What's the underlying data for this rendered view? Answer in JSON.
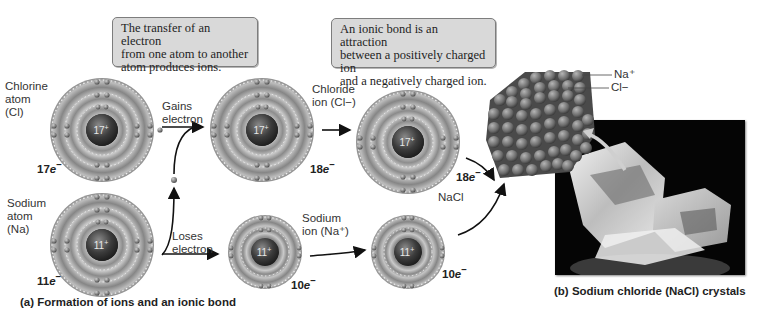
{
  "callouts": {
    "transfer": {
      "line1": "The transfer of an electron",
      "line2": "from one atom to another",
      "line3": "atom produces ions."
    },
    "ionic_bond": {
      "line1": "An ionic bond is an attraction",
      "line2": "between a positively charged ion",
      "line3": "and a negatively charged ion."
    }
  },
  "atoms": {
    "chlorine_atom": {
      "name_line1": "Chlorine",
      "name_line2": "atom",
      "name_line3": "(Cl)",
      "nucleus": "17",
      "nucleus_charge": "+",
      "electron_count": "17",
      "electron_suffix": "e",
      "electron_sign": "−"
    },
    "sodium_atom": {
      "name_line1": "Sodium",
      "name_line2": "atom",
      "name_line3": "(Na)",
      "nucleus": "11",
      "nucleus_charge": "+",
      "electron_count": "11",
      "electron_suffix": "e",
      "electron_sign": "−"
    },
    "chloride_ion": {
      "name_line1": "Chloride",
      "name_line2": "ion (Cl−)",
      "nucleus": "17",
      "nucleus_charge": "+",
      "electron_count": "18",
      "electron_suffix": "e",
      "electron_sign": "−"
    },
    "sodium_ion": {
      "name_line1": "Sodium",
      "name_line2": "ion (Na⁺)",
      "nucleus": "11",
      "nucleus_charge": "+",
      "electron_count": "10",
      "electron_suffix": "e",
      "electron_sign": "−"
    },
    "nacl_chloride": {
      "nucleus": "17",
      "nucleus_charge": "+",
      "electron_count": "18",
      "electron_suffix": "e",
      "electron_sign": "−"
    },
    "nacl_sodium": {
      "nucleus": "11",
      "nucleus_charge": "+",
      "electron_count": "10",
      "electron_suffix": "e",
      "electron_sign": "−"
    }
  },
  "arrows": {
    "gains": {
      "line1": "Gains",
      "line2": "electron"
    },
    "loses": {
      "line1": "Loses",
      "line2": "electron"
    }
  },
  "nacl_label": "NaCl",
  "lattice_legend": {
    "na": "Na⁺",
    "cl": "Cl−"
  },
  "captions": {
    "a": "(a) Formation of ions and an ionic bond",
    "b": "(b) Sodium chloride (NaCl) crystals"
  },
  "colors": {
    "callout_bg": "#d9d9d9",
    "shell_dark": "#7a7a7a",
    "shell_light": "#c9c9c9",
    "nucleus": "#3a3a3a",
    "photo_bg": "#050505"
  }
}
